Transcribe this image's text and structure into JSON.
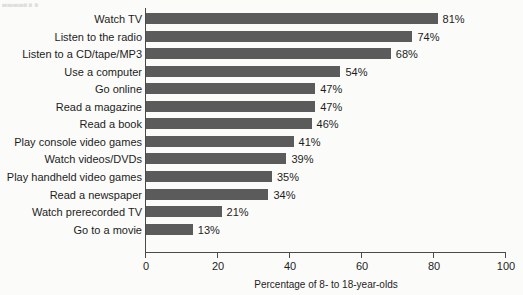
{
  "caption_fragment": "▄▄▄▄▖▖▖",
  "chart_data": {
    "type": "bar",
    "orientation": "horizontal",
    "title": "",
    "xlabel": "Percentage of 8- to 18-year-olds",
    "ylabel": "",
    "xlim": [
      0,
      100
    ],
    "xticks": [
      0,
      20,
      40,
      60,
      80,
      100
    ],
    "xtick_labels": [
      "0",
      "20",
      "40",
      "60",
      "80",
      "100"
    ],
    "grid": false,
    "legend": null,
    "bar_color": "#5b5b5b",
    "value_suffix": "%",
    "categories": [
      "Watch TV",
      "Listen to the radio",
      "Listen to a CD/tape/MP3",
      "Use a computer",
      "Go online",
      "Read a magazine",
      "Read a book",
      "Play console video games",
      "Watch videos/DVDs",
      "Play handheld video games",
      "Read a newspaper",
      "Watch prerecorded TV",
      "Go to a movie"
    ],
    "values": [
      81,
      74,
      68,
      54,
      47,
      47,
      46,
      41,
      39,
      35,
      34,
      21,
      13
    ],
    "value_labels": [
      "81%",
      "74%",
      "68%",
      "54%",
      "47%",
      "47%",
      "46%",
      "41%",
      "39%",
      "35%",
      "34%",
      "21%",
      "13%"
    ]
  }
}
